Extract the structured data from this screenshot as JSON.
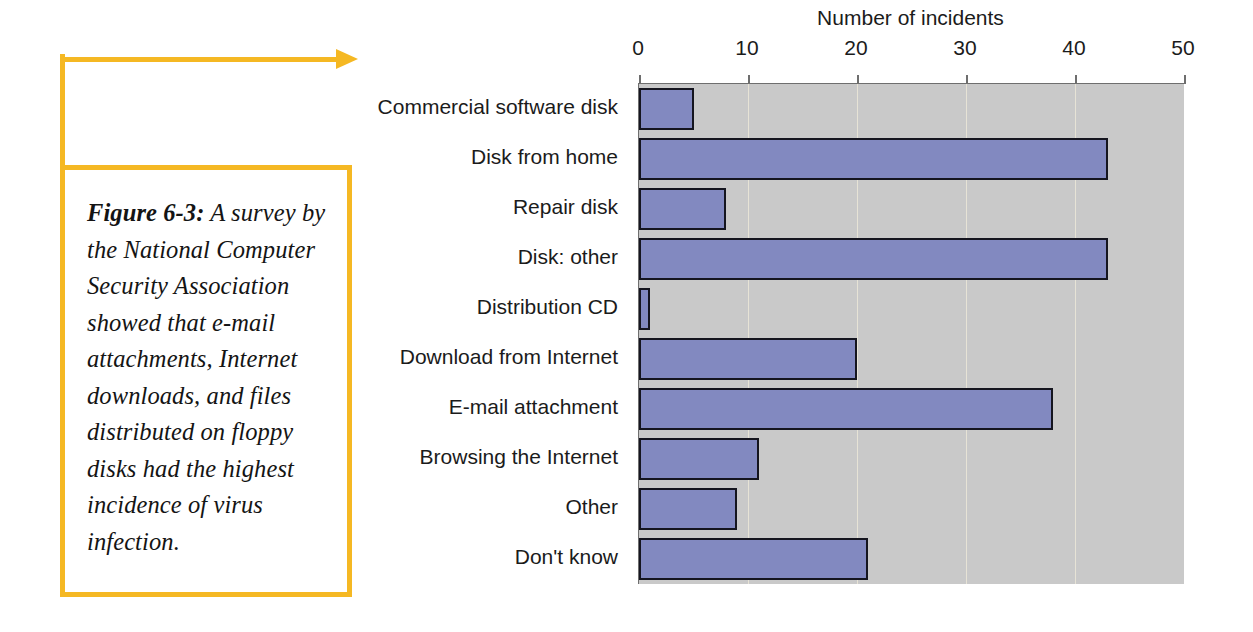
{
  "figure": {
    "caption_label": "Figure 6-3:",
    "caption_body": " A survey by the National Computer Security Association showed that e-mail attachments, Internet downloads, and files distributed on floppy disks had the highest incidence of virus infection.",
    "accent_color": "#f5b823"
  },
  "chart_data": {
    "type": "bar",
    "orientation": "horizontal",
    "title": "Number of incidents",
    "xlabel": "Number of incidents",
    "ylabel": "",
    "xlim": [
      0,
      50
    ],
    "ticks": [
      0,
      10,
      20,
      30,
      40,
      50
    ],
    "tick_labels": [
      "0",
      "10",
      "20",
      "30",
      "40",
      "50"
    ],
    "grid": true,
    "legend": false,
    "plot_background": "#c9c9c9",
    "bar_color": "#8289c0",
    "bar_edge_color": "#15151f",
    "categories": [
      "Commercial software disk",
      "Disk from home",
      "Repair disk",
      "Disk: other",
      "Distribution CD",
      "Download from Internet",
      "E-mail attachment",
      "Browsing the Internet",
      "Other",
      "Don't know"
    ],
    "values": [
      5,
      43,
      8,
      43,
      1,
      20,
      38,
      11,
      9,
      21
    ]
  }
}
